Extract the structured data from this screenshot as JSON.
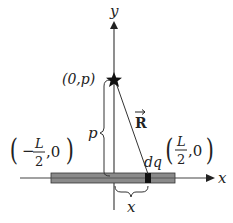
{
  "diagram": {
    "type": "physics-figure",
    "colors": {
      "stroke": "#222222",
      "rod_fill": "#8a8a8a",
      "rod_inner": "#6e6e6e",
      "charge_element": "#111111"
    },
    "axes": {
      "x_label": "x",
      "y_label": "y"
    },
    "point": {
      "label": "(0,p)",
      "marker": "star-icon"
    },
    "rod": {
      "left_label_sign": "−",
      "left_label_num": "L",
      "left_label_den": "2",
      "left_label_tail": ",0",
      "right_label_num": "L",
      "right_label_den": "2",
      "right_label_tail": ",0"
    },
    "element": {
      "label": "dq"
    },
    "vector": {
      "label": "R"
    },
    "distances": {
      "vertical": "p",
      "horizontal": "x"
    }
  }
}
